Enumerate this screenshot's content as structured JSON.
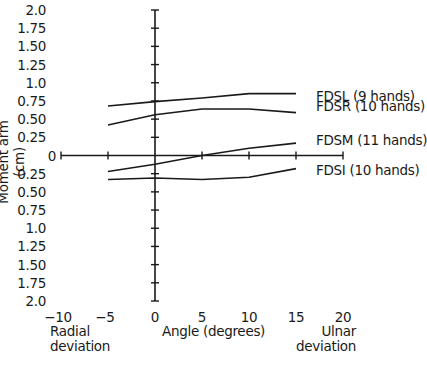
{
  "chart_data": {
    "type": "line",
    "title": "",
    "xlabel": "Angle (degrees)",
    "ylabel": "Moment arm (cm)",
    "x_ticks": [
      "-10",
      "-5",
      "0",
      "5",
      "10",
      "15",
      "20"
    ],
    "y_ticks": [
      "2.0",
      "1.75",
      "1.50",
      "1.25",
      "1.0",
      "0.75",
      "0.50",
      "0.25",
      "0",
      "0.25",
      "0.50",
      "0.75",
      "1.0",
      "1.25",
      "1.50",
      "1.75",
      "2.0"
    ],
    "xlim": [
      -10,
      20
    ],
    "ylim": [
      -2.0,
      2.0
    ],
    "x_annotations": {
      "left": "Radial deviation",
      "right": "Ulnar deviation"
    },
    "grid": false,
    "x": [
      -5,
      0,
      5,
      10,
      15
    ],
    "series": [
      {
        "name": "FDSL (9 hands)",
        "values": [
          0.68,
          0.74,
          0.79,
          0.85,
          0.85
        ]
      },
      {
        "name": "FDSR (10 hands)",
        "values": [
          0.42,
          0.56,
          0.64,
          0.64,
          0.59
        ]
      },
      {
        "name": "FDSM (11 hands)",
        "values": [
          -0.22,
          -0.12,
          0.0,
          0.1,
          0.17
        ]
      },
      {
        "name": "FDSI (10 hands)",
        "values": [
          -0.33,
          -0.31,
          -0.33,
          -0.3,
          -0.18
        ]
      }
    ]
  },
  "labels": {
    "ylabel": "Moment arm (cm)",
    "xlabel": "Angle (degrees)",
    "radial": [
      "Radial",
      "deviation"
    ],
    "ulnar": [
      "Ulnar",
      "deviation"
    ],
    "legend": [
      "FDSL (9 hands)",
      "FDSR (10 hands)",
      "FDSM (11 hands)",
      "FDSI (10 hands)"
    ]
  }
}
